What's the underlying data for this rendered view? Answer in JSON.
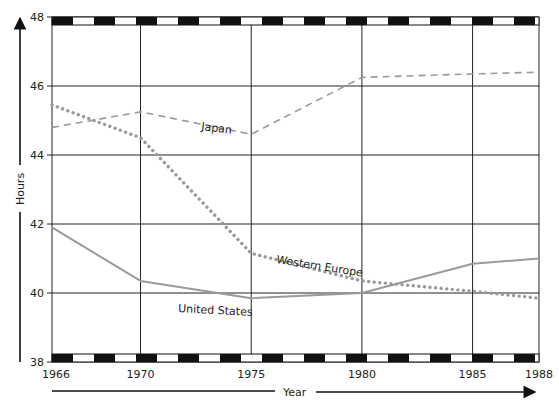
{
  "chart_data": {
    "type": "line",
    "title": "",
    "xlabel": "Year",
    "ylabel": "Hours",
    "x": [
      1966,
      1970,
      1975,
      1980,
      1985,
      1988
    ],
    "x_tick_labels": [
      "1966",
      "1970",
      "1975",
      "1980",
      "1985",
      "1988"
    ],
    "y_ticks": [
      38,
      40,
      42,
      44,
      46,
      48
    ],
    "y_tick_labels": [
      "38",
      "40",
      "42",
      "44",
      "46",
      "48"
    ],
    "xlim": [
      1966,
      1988
    ],
    "ylim": [
      38,
      48
    ],
    "grid": true,
    "legend": "none (series labeled inline)",
    "series": [
      {
        "name": "Japan",
        "label": "Japan",
        "style": "dashed",
        "color": "#9a9a9a",
        "values": [
          44.8,
          45.25,
          44.6,
          46.25,
          46.35,
          46.4
        ]
      },
      {
        "name": "Western Europe",
        "label": "Western Europe",
        "style": "dotted",
        "color": "#9a9a9a",
        "values": [
          45.45,
          44.5,
          41.15,
          40.35,
          40.05,
          39.85
        ]
      },
      {
        "name": "United States",
        "label": "United States",
        "style": "solid",
        "color": "#9a9a9a",
        "values": [
          41.9,
          40.35,
          39.85,
          40.0,
          40.85,
          41.0
        ]
      }
    ]
  }
}
